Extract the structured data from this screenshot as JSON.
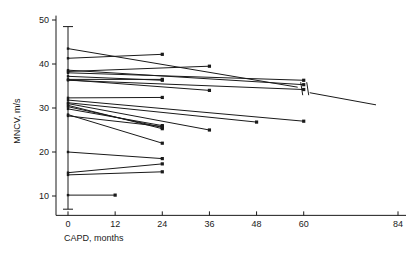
{
  "chart_data": {
    "type": "line",
    "title": "",
    "subtitle": "",
    "xlabel": "CAPD, months",
    "ylabel": "MNCV, m/s",
    "xlim": [
      0,
      84
    ],
    "ylim": [
      5,
      52
    ],
    "xticks": [
      0,
      12,
      24,
      36,
      48,
      60,
      84
    ],
    "xtick_labels": [
      "0",
      "12",
      "24",
      "36",
      "48",
      "60",
      "84"
    ],
    "yticks": [
      10,
      20,
      30,
      40,
      50
    ],
    "ytick_labels": [
      "10",
      "20",
      "30",
      "40",
      "50"
    ],
    "grid": false,
    "legend": null,
    "marker": "square",
    "annotations": [
      {
        "name": "axis-break",
        "kind": "line-break-marker",
        "x": 60,
        "y": 36.2,
        "label": "//"
      }
    ],
    "errorbar": {
      "name": "baseline-range-bar",
      "x": 0,
      "low": 7.0,
      "high": 48.5,
      "caps": true
    },
    "series": [
      {
        "name": "patient-1",
        "x": [
          0,
          60
        ],
        "values": [
          43.5,
          34.5
        ],
        "break_at": 60,
        "extends_to": 84
      },
      {
        "name": "patient-2",
        "x": [
          0,
          24
        ],
        "values": [
          41.3,
          42.2
        ]
      },
      {
        "name": "patient-3",
        "x": [
          0,
          60
        ],
        "values": [
          38.6,
          35.3
        ]
      },
      {
        "name": "patient-4",
        "x": [
          0,
          36
        ],
        "values": [
          38.3,
          39.5
        ]
      },
      {
        "name": "patient-5",
        "x": [
          0,
          60
        ],
        "values": [
          38.0,
          36.3
        ]
      },
      {
        "name": "patient-6",
        "x": [
          0,
          24
        ],
        "values": [
          37.2,
          36.3
        ]
      },
      {
        "name": "patient-7",
        "x": [
          0,
          24
        ],
        "values": [
          36.5,
          36.5
        ]
      },
      {
        "name": "patient-8",
        "x": [
          0,
          36
        ],
        "values": [
          36.4,
          34.0
        ]
      },
      {
        "name": "patient-9",
        "x": [
          0,
          60
        ],
        "values": [
          36.3,
          34.2
        ]
      },
      {
        "name": "patient-10",
        "x": [
          0,
          24
        ],
        "values": [
          32.3,
          32.4
        ]
      },
      {
        "name": "patient-11",
        "x": [
          0,
          60
        ],
        "values": [
          31.8,
          27.0
        ]
      },
      {
        "name": "patient-12",
        "x": [
          0,
          48
        ],
        "values": [
          31.2,
          26.8
        ]
      },
      {
        "name": "patient-13",
        "x": [
          0,
          36
        ],
        "values": [
          31.0,
          25.0
        ]
      },
      {
        "name": "patient-14",
        "x": [
          0,
          24
        ],
        "values": [
          30.6,
          25.3
        ]
      },
      {
        "name": "patient-15",
        "x": [
          0,
          24
        ],
        "values": [
          30.3,
          25.6
        ]
      },
      {
        "name": "patient-16",
        "x": [
          0,
          24
        ],
        "values": [
          29.8,
          26.0
        ]
      },
      {
        "name": "patient-17",
        "x": [
          0,
          24
        ],
        "values": [
          28.5,
          22.0
        ]
      },
      {
        "name": "patient-18",
        "x": [
          0,
          24
        ],
        "values": [
          28.2,
          25.8
        ]
      },
      {
        "name": "patient-19",
        "x": [
          0,
          24
        ],
        "values": [
          20.0,
          18.5
        ]
      },
      {
        "name": "patient-20",
        "x": [
          0,
          24
        ],
        "values": [
          15.3,
          17.3
        ]
      },
      {
        "name": "patient-21",
        "x": [
          0,
          24
        ],
        "values": [
          14.8,
          15.5
        ]
      },
      {
        "name": "patient-22",
        "x": [
          0,
          12
        ],
        "values": [
          10.2,
          10.2
        ]
      }
    ]
  },
  "axes": {
    "x_axis_name": "x-axis",
    "y_axis_name": "y-axis"
  }
}
